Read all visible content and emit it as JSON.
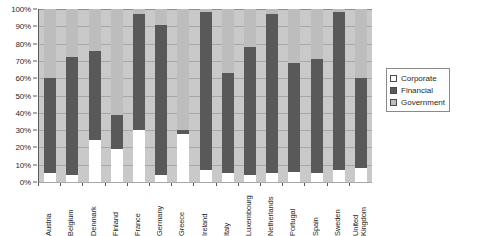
{
  "chart_data": {
    "type": "bar",
    "subtype": "stacked-percent",
    "title": "",
    "subtitle": "",
    "xlabel": "",
    "ylabel": "",
    "ylim": [
      0,
      100
    ],
    "ytick_labels": [
      "100%",
      "90%",
      "80%",
      "70%",
      "60%",
      "50%",
      "40%",
      "30%",
      "20%",
      "10%",
      "0%"
    ],
    "ytick_values": [
      100,
      90,
      80,
      70,
      60,
      50,
      40,
      30,
      20,
      10,
      0
    ],
    "grid": true,
    "legend_position": "right",
    "categories": [
      "Austria",
      "Belgium",
      "Denmark",
      "Finland",
      "France",
      "Germany",
      "Greece",
      "Ireland",
      "Italy",
      "Luxembourg",
      "Netherlands",
      "Portugal",
      "Spain",
      "Sweden",
      "United Kingdom"
    ],
    "series": [
      {
        "name": "Corporate",
        "color": "#ffffff",
        "values": [
          5,
          4,
          24,
          19,
          30,
          4,
          28,
          7,
          5,
          4,
          5,
          6,
          5,
          7,
          8
        ]
      },
      {
        "name": "Financial",
        "color": "#595959",
        "values": [
          55,
          68,
          52,
          20,
          67,
          87,
          2,
          91,
          58,
          74,
          92,
          63,
          66,
          91,
          52
        ]
      },
      {
        "name": "Government",
        "color": "#bdbdbd",
        "values": [
          40,
          28,
          24,
          61,
          3,
          9,
          70,
          2,
          37,
          22,
          3,
          31,
          29,
          2,
          40
        ]
      }
    ]
  },
  "legend": {
    "items": [
      {
        "label": "Corporate",
        "swatch_color": "#ffffff"
      },
      {
        "label": "Financial",
        "swatch_color": "#595959"
      },
      {
        "label": "Government",
        "swatch_color": "#bdbdbd"
      }
    ]
  },
  "colors": {
    "plot_background": "#c9c9c9",
    "gridline": "#a8a8a8",
    "axis_line": "#5a5a5a",
    "text": "#1f1f1f"
  }
}
